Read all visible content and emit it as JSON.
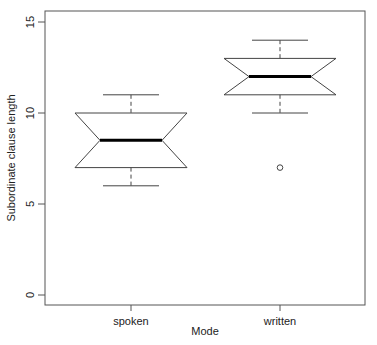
{
  "chart_data": {
    "type": "boxplot",
    "title": "",
    "xlabel": "Mode",
    "ylabel": "Subordinate clause length",
    "ylim": [
      0,
      15
    ],
    "yticks": [
      0,
      5,
      10,
      15
    ],
    "categories": [
      "spoken",
      "written"
    ],
    "notched": true,
    "boxes": [
      {
        "name": "spoken",
        "lower_whisker": 6,
        "q1": 7,
        "median": 8.5,
        "q3": 10,
        "upper_whisker": 11,
        "notch_low": 7,
        "notch_high": 10,
        "outliers": []
      },
      {
        "name": "written",
        "lower_whisker": 10,
        "q1": 11,
        "median": 12,
        "q3": 13,
        "upper_whisker": 14,
        "notch_low": 11,
        "notch_high": 13,
        "outliers": [
          7
        ]
      }
    ]
  }
}
